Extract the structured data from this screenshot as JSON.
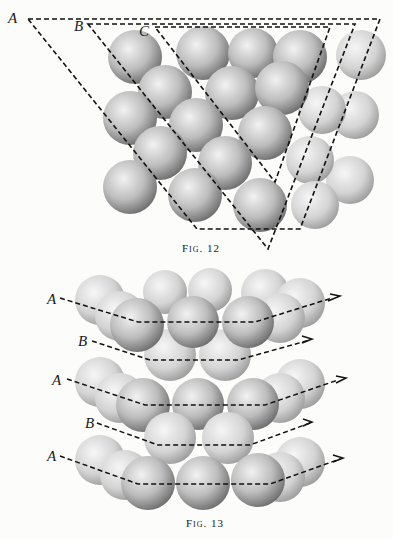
{
  "figures": [
    {
      "id": "fig12",
      "caption": "Fig. 12",
      "plane_labels": [
        "A",
        "B",
        "C"
      ],
      "description": "Close-packed spheres with three dashed triangular planes A, B, C"
    },
    {
      "id": "fig13",
      "caption": "Fig. 13",
      "layer_labels": [
        "A",
        "B",
        "A",
        "B",
        "A"
      ],
      "description": "Hexagonal close-packed layers in ABAB stacking with dashed layer outlines"
    }
  ],
  "colors": {
    "background": "#fcfcfa",
    "sphere_light": "#e8e8e8",
    "sphere_dark": "#6a6a6a",
    "dash": "#111111"
  }
}
